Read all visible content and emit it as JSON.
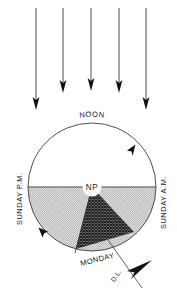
{
  "diagram": {
    "labels": {
      "noon": "NOON",
      "north_pole": "NP",
      "sunday_pm": "SUNDAY P.M.",
      "sunday_am": "SUNDAY A.M.",
      "monday": "MONDAY",
      "date_line": "D.L."
    },
    "sun_rays": {
      "icon": "down-arrow-icon",
      "count": 5,
      "direction": "downward",
      "x_positions": [
        36,
        63,
        91,
        119,
        146
      ],
      "top_y": 8,
      "tip_y": [
        107,
        96,
        94,
        96,
        107
      ]
    },
    "earth": {
      "center_x": 92,
      "center_y": 187,
      "radius": 64,
      "day_half": "top",
      "night_half": "bottom",
      "rotation_direction": "counterclockwise-arrowheads-on-rim"
    },
    "regions": [
      {
        "name": "daylight-hemisphere",
        "fill": "white",
        "color": "#ffffff",
        "description": "upper half of circle, sunlit"
      },
      {
        "name": "night-hemisphere",
        "fill": "light-stipple",
        "color": "#b8b8b8",
        "description": "lower half of circle, darkness"
      },
      {
        "name": "monday-wedge",
        "fill": "dark-crosshatch",
        "color": "#4d4d4d",
        "description": "wedge between date line and midnight meridian"
      },
      {
        "name": "north-pole-disc",
        "fill": "white",
        "color": "#ffffff"
      }
    ],
    "rim_arrows": [
      {
        "name": "upper-right-rim-arrow",
        "angle_deg": 312,
        "direction": "clockwise"
      },
      {
        "name": "lower-left-rim-arrow",
        "angle_deg": 150,
        "direction": "clockwise"
      }
    ],
    "date_line_arrow": {
      "name": "date-line-arrow",
      "direction": "upper-right",
      "color": "#111111"
    },
    "colors": {
      "ink": "#2b2b2b",
      "night_shade": "#b8b8b8",
      "monday_shade": "#4d4d4d",
      "background": "#ffffff"
    }
  }
}
